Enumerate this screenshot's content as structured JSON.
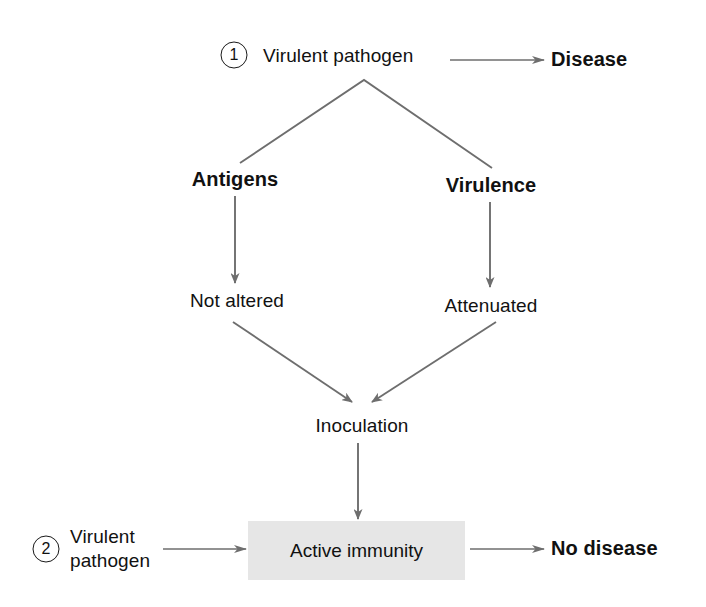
{
  "diagram": {
    "background_color": "#ffffff",
    "line_color": "#6e6e6e",
    "text_color": "#111111",
    "box_fill_color": "#e6e6e6"
  },
  "steps": {
    "step_one_number": "1",
    "step_two_number": "2"
  },
  "nodes": {
    "virulent_pathogen_top": "Virulent pathogen",
    "disease": "Disease",
    "antigens": "Antigens",
    "virulence": "Virulence",
    "not_altered": "Not altered",
    "attenuated": "Attenuated",
    "inoculation": "Inoculation",
    "active_immunity": "Active immunity",
    "virulent_pathogen_bottom_line1": "Virulent",
    "virulent_pathogen_bottom_line2": "pathogen",
    "no_disease": "No disease"
  }
}
